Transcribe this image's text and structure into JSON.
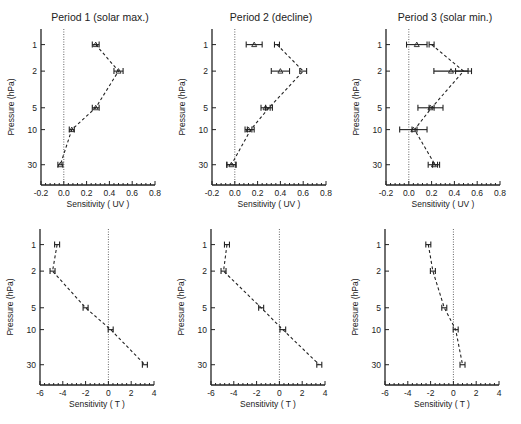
{
  "chart_data": [
    {
      "type": "line",
      "title": "Period 1 (solar max.)",
      "xlabel": "Sensitivity ( UV )",
      "ylabel": "Pressure (hPa)",
      "xlim": [
        -0.2,
        0.8
      ],
      "xticks": [
        "-0.2",
        "0.0",
        "0.2",
        "0.4",
        "0.6",
        "0.8"
      ],
      "y": [
        1,
        2,
        5,
        10,
        30
      ],
      "yticks": [
        "1",
        "2",
        "5",
        "10",
        "30"
      ],
      "yscale": "log-reversed",
      "series": [
        {
          "name": "dashed",
          "marker": "triangle",
          "line": "dashed",
          "values": [
            0.28,
            0.48,
            0.28,
            0.07,
            -0.03
          ],
          "errors": [
            0.03,
            0.04,
            0.03,
            0.02,
            0.02
          ]
        }
      ]
    },
    {
      "type": "line",
      "title": "Period 2 (decline)",
      "xlabel": "Sensitivity ( UV )",
      "ylabel": "Pressure (hPa)",
      "xlim": [
        -0.2,
        0.8
      ],
      "xticks": [
        "-0.2",
        "0.0",
        "0.2",
        "0.4",
        "0.6",
        "0.8"
      ],
      "y": [
        1,
        2,
        5,
        10,
        30
      ],
      "yticks": [
        "1",
        "2",
        "5",
        "10",
        "30"
      ],
      "yscale": "log-reversed",
      "series": [
        {
          "name": "dashed",
          "marker": "none",
          "line": "dashed",
          "values": [
            0.37,
            0.6,
            0.3,
            0.14,
            -0.03
          ],
          "errors": [
            0.02,
            0.03,
            0.03,
            0.03,
            0.04
          ]
        },
        {
          "name": "triangles",
          "marker": "triangle",
          "line": "none",
          "values": [
            0.17,
            0.4,
            0.27,
            0.12,
            -0.03
          ],
          "errors": [
            0.07,
            0.08,
            0.04,
            0.03,
            0.04
          ]
        }
      ]
    },
    {
      "type": "line",
      "title": "Period 3 (solar min.)",
      "xlabel": "Sensitivity ( UV )",
      "ylabel": "Pressure (hPa)",
      "xlim": [
        -0.2,
        0.8
      ],
      "xticks": [
        "-0.2",
        "0.0",
        "0.2",
        "0.4",
        "0.6",
        "0.8"
      ],
      "y": [
        1,
        2,
        5,
        10,
        30
      ],
      "yticks": [
        "1",
        "2",
        "5",
        "10",
        "30"
      ],
      "yscale": "log-reversed",
      "series": [
        {
          "name": "dashed",
          "marker": "none",
          "line": "dashed",
          "values": [
            0.2,
            0.48,
            0.2,
            0.05,
            0.23
          ],
          "errors": [
            0.0,
            0.07,
            0.0,
            0.0,
            0.0
          ]
        },
        {
          "name": "triangles",
          "marker": "triangle",
          "line": "none",
          "values": [
            0.07,
            0.37,
            0.19,
            0.04,
            0.22
          ],
          "errors": [
            0.09,
            0.15,
            0.11,
            0.12,
            0.05
          ]
        }
      ]
    },
    {
      "type": "line",
      "title": "",
      "xlabel": "Sensitivity ( T )",
      "ylabel": "Pressure (hPa)",
      "xlim": [
        -6,
        4
      ],
      "xticks": [
        "-6",
        "-4",
        "-2",
        "0",
        "2",
        "4"
      ],
      "y": [
        1,
        2,
        5,
        10,
        30
      ],
      "yticks": [
        "1",
        "2",
        "5",
        "10",
        "30"
      ],
      "yscale": "log-reversed",
      "series": [
        {
          "name": "dashed",
          "marker": "none",
          "line": "dashed",
          "values": [
            -4.5,
            -4.9,
            -2.0,
            0.2,
            3.2
          ],
          "errors": [
            0.2,
            0.2,
            0.15,
            0.2,
            0.2
          ]
        }
      ]
    },
    {
      "type": "line",
      "title": "",
      "xlabel": "Sensitivity ( T )",
      "ylabel": "Pressure (hPa)",
      "xlim": [
        -6,
        4
      ],
      "xticks": [
        "-6",
        "-4",
        "-2",
        "0",
        "2",
        "4"
      ],
      "y": [
        1,
        2,
        5,
        10,
        30
      ],
      "yticks": [
        "1",
        "2",
        "5",
        "10",
        "30"
      ],
      "yscale": "log-reversed",
      "series": [
        {
          "name": "dashed",
          "marker": "none",
          "line": "dashed",
          "values": [
            -4.6,
            -4.9,
            -1.6,
            0.3,
            3.5
          ],
          "errors": [
            0.1,
            0.1,
            0.1,
            0.25,
            0.2
          ]
        }
      ]
    },
    {
      "type": "line",
      "title": "",
      "xlabel": "Sensitivity ( T )",
      "ylabel": "Pressure (hPa)",
      "xlim": [
        -6,
        4
      ],
      "xticks": [
        "-6",
        "-4",
        "-2",
        "0",
        "2",
        "4"
      ],
      "y": [
        1,
        2,
        5,
        10,
        30
      ],
      "yticks": [
        "1",
        "2",
        "5",
        "10",
        "30"
      ],
      "yscale": "log-reversed",
      "series": [
        {
          "name": "dashed",
          "marker": "none",
          "line": "dashed",
          "values": [
            -2.2,
            -1.8,
            -0.8,
            0.2,
            0.8
          ],
          "errors": [
            0.2,
            0.15,
            0.15,
            0.15,
            0.15
          ]
        }
      ]
    }
  ]
}
